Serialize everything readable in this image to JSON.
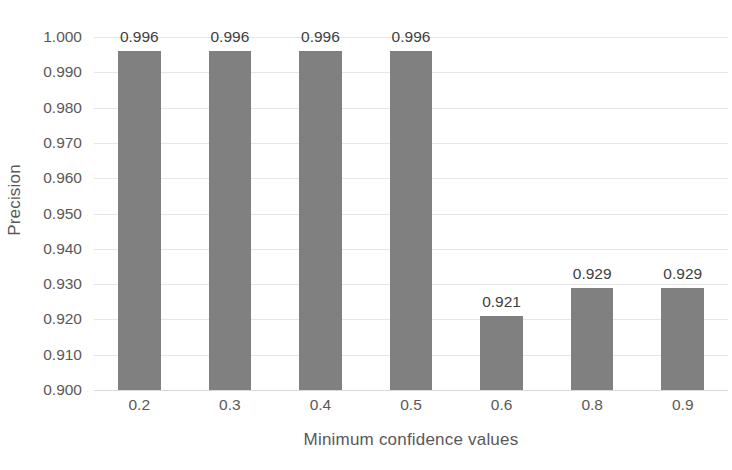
{
  "chart_data": {
    "type": "bar",
    "title": "",
    "xlabel": "Minimum confidence values",
    "ylabel": "Precision",
    "categories": [
      "0.2",
      "0.3",
      "0.4",
      "0.5",
      "0.6",
      "0.8",
      "0.9"
    ],
    "values": [
      0.996,
      0.996,
      0.996,
      0.996,
      0.921,
      0.929,
      0.929
    ],
    "data_labels": [
      "0.996",
      "0.996",
      "0.996",
      "0.996",
      "0.921",
      "0.929",
      "0.929"
    ],
    "ylim": [
      0.9,
      1.0
    ],
    "ytick_labels": [
      "1.000",
      "0.990",
      "0.980",
      "0.970",
      "0.960",
      "0.950",
      "0.940",
      "0.930",
      "0.920",
      "0.910",
      "0.900"
    ],
    "ytick_values": [
      1.0,
      0.99,
      0.98,
      0.97,
      0.96,
      0.95,
      0.94,
      0.93,
      0.92,
      0.91,
      0.9
    ],
    "grid": true,
    "legend": false,
    "legend_position": "none",
    "series": [
      {
        "name": "Precision",
        "values": [
          0.996,
          0.996,
          0.996,
          0.996,
          0.921,
          0.929,
          0.929
        ]
      }
    ],
    "colors": {
      "bar_fill": "#808080",
      "gridline": "#e6e6e6",
      "baseline": "#d9d9d9",
      "tick_text": "#595959",
      "data_label_text": "#404040",
      "background": "#ffffff"
    }
  }
}
